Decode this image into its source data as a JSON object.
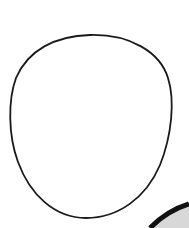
{
  "image": {
    "description": "Line drawing of an egg-shaped outline with part of a dark curved object in the lower-right corner",
    "outline_color": "#1a1a1a",
    "background_color": "#ffffff",
    "corner_object_color": "#111111",
    "corner_object_fill": "#d8d8d8"
  }
}
